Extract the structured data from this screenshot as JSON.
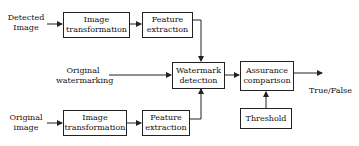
{
  "diagram": {
    "type": "block-diagram",
    "inputs": {
      "detected_image": [
        "Detected",
        "Image"
      ],
      "original_watermarking": [
        "Original",
        "watermarking"
      ],
      "original_image": [
        "Original",
        "image"
      ]
    },
    "blocks": {
      "top_image_transformation": [
        "Image",
        "transformation"
      ],
      "top_feature_extraction": [
        "Feature",
        "extraction"
      ],
      "watermark_detection": [
        "Watermark",
        "detection"
      ],
      "assurance_comparison": [
        "Assurance",
        "comparison"
      ],
      "threshold": [
        "Threshold"
      ],
      "bottom_image_transformation": [
        "Image",
        "transformation"
      ],
      "bottom_feature_extraction": [
        "Feature",
        "extraction"
      ]
    },
    "output": "True/False",
    "edges": [
      [
        "Detected Image",
        "Image transformation (top)"
      ],
      [
        "Image transformation (top)",
        "Feature extraction (top)"
      ],
      [
        "Feature extraction (top)",
        "Watermark detection"
      ],
      [
        "Original watermarking",
        "Watermark detection"
      ],
      [
        "Original image",
        "Image transformation (bottom)"
      ],
      [
        "Image transformation (bottom)",
        "Feature extraction (bottom)"
      ],
      [
        "Feature extraction (bottom)",
        "Watermark detection"
      ],
      [
        "Watermark detection",
        "Assurance comparison"
      ],
      [
        "Threshold",
        "Assurance comparison"
      ],
      [
        "Assurance comparison",
        "True/False"
      ]
    ],
    "colors": {
      "line": "#222222",
      "background": "#ffffff"
    }
  }
}
